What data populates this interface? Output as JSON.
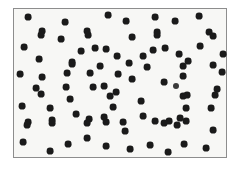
{
  "image": {
    "title": "Random dot pattern stimulus",
    "width": 240,
    "height": 170,
    "background_color": "#ffffff"
  },
  "frame": {
    "name": "plot-frame",
    "x": 13,
    "y": 8,
    "width": 214,
    "height": 150,
    "fill_color": "#f7f7f5",
    "border_color": "#8d8d8d",
    "border_width": 1
  },
  "dots": {
    "count": 93,
    "color": "#1a1a1a",
    "soft_color": "#3a3a3a",
    "default_radius": 3.4,
    "points": [
      {
        "x": 28,
        "y": 17,
        "r": 3.4
      },
      {
        "x": 65,
        "y": 22,
        "r": 3.4
      },
      {
        "x": 108,
        "y": 15,
        "r": 3.4
      },
      {
        "x": 42,
        "y": 31,
        "r": 3.4
      },
      {
        "x": 87,
        "y": 31,
        "r": 3.4
      },
      {
        "x": 126,
        "y": 21,
        "r": 3.4
      },
      {
        "x": 155,
        "y": 17,
        "r": 3.4
      },
      {
        "x": 175,
        "y": 21,
        "r": 3.4
      },
      {
        "x": 199,
        "y": 16,
        "r": 3.4
      },
      {
        "x": 157,
        "y": 32,
        "r": 3.4
      },
      {
        "x": 209,
        "y": 32,
        "r": 3.4
      },
      {
        "x": 24,
        "y": 47,
        "r": 3.4
      },
      {
        "x": 61,
        "y": 39,
        "r": 3.4
      },
      {
        "x": 88,
        "y": 35,
        "r": 3.4
      },
      {
        "x": 41,
        "y": 35,
        "r": 3.4
      },
      {
        "x": 81,
        "y": 51,
        "r": 3.4
      },
      {
        "x": 95,
        "y": 48,
        "r": 3.4
      },
      {
        "x": 106,
        "y": 49,
        "r": 3.4
      },
      {
        "x": 117,
        "y": 56,
        "r": 3.4
      },
      {
        "x": 39,
        "y": 59,
        "r": 3.4
      },
      {
        "x": 72,
        "y": 62,
        "r": 3.4
      },
      {
        "x": 132,
        "y": 37,
        "r": 3.4
      },
      {
        "x": 157,
        "y": 35,
        "r": 3.4
      },
      {
        "x": 213,
        "y": 36,
        "r": 3.4
      },
      {
        "x": 200,
        "y": 46,
        "r": 3.4
      },
      {
        "x": 153,
        "y": 50,
        "r": 3.4
      },
      {
        "x": 165,
        "y": 48,
        "r": 3.4
      },
      {
        "x": 179,
        "y": 54,
        "r": 3.4
      },
      {
        "x": 143,
        "y": 56,
        "r": 3.4
      },
      {
        "x": 188,
        "y": 61,
        "r": 3.4
      },
      {
        "x": 223,
        "y": 54,
        "r": 3.4
      },
      {
        "x": 42,
        "y": 77,
        "r": 3.4
      },
      {
        "x": 67,
        "y": 73,
        "r": 3.4
      },
      {
        "x": 72,
        "y": 64,
        "r": 3.4
      },
      {
        "x": 36,
        "y": 88,
        "r": 3.4
      },
      {
        "x": 66,
        "y": 87,
        "r": 3.4
      },
      {
        "x": 93,
        "y": 87,
        "r": 3.4
      },
      {
        "x": 104,
        "y": 86,
        "r": 3.4
      },
      {
        "x": 116,
        "y": 92,
        "r": 3.4
      },
      {
        "x": 183,
        "y": 66,
        "r": 3.4
      },
      {
        "x": 213,
        "y": 65,
        "r": 3.4
      },
      {
        "x": 132,
        "y": 79,
        "r": 3.4
      },
      {
        "x": 164,
        "y": 82,
        "r": 3.4
      },
      {
        "x": 176,
        "y": 86,
        "r": 3.0
      },
      {
        "x": 183,
        "y": 76,
        "r": 3.4
      },
      {
        "x": 217,
        "y": 89,
        "r": 3.4
      },
      {
        "x": 187,
        "y": 95,
        "r": 3.4
      },
      {
        "x": 22,
        "y": 106,
        "r": 3.4
      },
      {
        "x": 50,
        "y": 108,
        "r": 3.4
      },
      {
        "x": 70,
        "y": 99,
        "r": 3.4
      },
      {
        "x": 76,
        "y": 114,
        "r": 3.4
      },
      {
        "x": 110,
        "y": 96,
        "r": 3.4
      },
      {
        "x": 113,
        "y": 107,
        "r": 3.4
      },
      {
        "x": 89,
        "y": 119,
        "r": 3.4
      },
      {
        "x": 104,
        "y": 117,
        "r": 3.4
      },
      {
        "x": 52,
        "y": 120,
        "r": 3.4
      },
      {
        "x": 28,
        "y": 122,
        "r": 3.4
      },
      {
        "x": 41,
        "y": 94,
        "r": 3.4
      },
      {
        "x": 141,
        "y": 101,
        "r": 3.4
      },
      {
        "x": 183,
        "y": 96,
        "r": 3.4
      },
      {
        "x": 215,
        "y": 95,
        "r": 3.4
      },
      {
        "x": 186,
        "y": 108,
        "r": 3.4
      },
      {
        "x": 211,
        "y": 108,
        "r": 3.4
      },
      {
        "x": 143,
        "y": 116,
        "r": 3.4
      },
      {
        "x": 155,
        "y": 121,
        "r": 3.4
      },
      {
        "x": 169,
        "y": 121,
        "r": 3.4
      },
      {
        "x": 180,
        "y": 118,
        "r": 3.4
      },
      {
        "x": 123,
        "y": 122,
        "r": 3.4
      },
      {
        "x": 27,
        "y": 125,
        "r": 3.4
      },
      {
        "x": 52,
        "y": 123,
        "r": 3.4
      },
      {
        "x": 87,
        "y": 123,
        "r": 3.4
      },
      {
        "x": 106,
        "y": 122,
        "r": 3.4
      },
      {
        "x": 125,
        "y": 131,
        "r": 3.4
      },
      {
        "x": 164,
        "y": 123,
        "r": 3.4
      },
      {
        "x": 177,
        "y": 125,
        "r": 3.4
      },
      {
        "x": 186,
        "y": 121,
        "r": 3.4
      },
      {
        "x": 213,
        "y": 130,
        "r": 3.4
      },
      {
        "x": 23,
        "y": 142,
        "r": 3.4
      },
      {
        "x": 50,
        "y": 151,
        "r": 3.4
      },
      {
        "x": 68,
        "y": 144,
        "r": 3.4
      },
      {
        "x": 87,
        "y": 138,
        "r": 3.4
      },
      {
        "x": 106,
        "y": 146,
        "r": 3.4
      },
      {
        "x": 130,
        "y": 149,
        "r": 3.4
      },
      {
        "x": 150,
        "y": 145,
        "r": 3.4
      },
      {
        "x": 168,
        "y": 152,
        "r": 3.4
      },
      {
        "x": 184,
        "y": 144,
        "r": 3.4
      },
      {
        "x": 206,
        "y": 148,
        "r": 3.4
      },
      {
        "x": 129,
        "y": 63,
        "r": 3.4
      },
      {
        "x": 147,
        "y": 67,
        "r": 3.4
      },
      {
        "x": 100,
        "y": 66,
        "r": 3.4
      },
      {
        "x": 118,
        "y": 74,
        "r": 3.4
      },
      {
        "x": 90,
        "y": 73,
        "r": 3.4
      },
      {
        "x": 222,
        "y": 72,
        "r": 3.4
      },
      {
        "x": 20,
        "y": 74,
        "r": 3.4
      }
    ]
  }
}
